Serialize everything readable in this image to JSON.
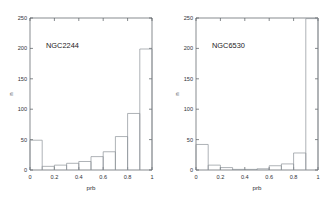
{
  "figure": {
    "background": "#ffffff",
    "axis_color": "#555a5e",
    "bar_color": "#8d9298",
    "text_color": "#303337"
  },
  "chart_data": [
    {
      "type": "bar",
      "title": "NGC2244",
      "xlabel": "prb",
      "ylabel": "n",
      "xlim": [
        0,
        1
      ],
      "ylim": [
        0,
        250
      ],
      "grid": false,
      "legend": null,
      "bin_width": 0.1,
      "xticks": [
        0,
        0.2,
        0.4,
        0.6,
        0.8,
        1
      ],
      "xticklabels": [
        "0",
        "0.2",
        "0.4",
        "0.6",
        "0.8",
        "1"
      ],
      "yticks": [
        0,
        50,
        100,
        150,
        200,
        250
      ],
      "yticklabels": [
        "0",
        "50",
        "100",
        "150",
        "200",
        "250"
      ],
      "bin_edges": [
        0,
        0.1,
        0.2,
        0.3,
        0.4,
        0.5,
        0.6,
        0.7,
        0.8,
        0.9,
        1.0
      ],
      "categories": [
        "0-0.1",
        "0.1-0.2",
        "0.2-0.3",
        "0.3-0.4",
        "0.4-0.5",
        "0.5-0.6",
        "0.6-0.7",
        "0.7-0.8",
        "0.8-0.9",
        "0.9-1.0"
      ],
      "values": [
        49,
        6,
        8,
        11,
        14,
        22,
        30,
        55,
        93,
        199
      ]
    },
    {
      "type": "bar",
      "title": "NGC6530",
      "xlabel": "prb",
      "ylabel": "n",
      "xlim": [
        0,
        1
      ],
      "ylim": [
        0,
        250
      ],
      "grid": false,
      "legend": null,
      "bin_width": 0.1,
      "xticks": [
        0,
        0.2,
        0.4,
        0.6,
        0.8,
        1
      ],
      "xticklabels": [
        "0",
        "0.2",
        "0.4",
        "0.6",
        "0.8",
        "1"
      ],
      "yticks": [
        0,
        50,
        100,
        150,
        200,
        250
      ],
      "yticklabels": [
        "0",
        "50",
        "100",
        "150",
        "200",
        "250"
      ],
      "bin_edges": [
        0,
        0.1,
        0.2,
        0.3,
        0.4,
        0.5,
        0.6,
        0.7,
        0.8,
        0.9,
        1.0
      ],
      "categories": [
        "0-0.1",
        "0.1-0.2",
        "0.2-0.3",
        "0.3-0.4",
        "0.4-0.5",
        "0.5-0.6",
        "0.6-0.7",
        "0.7-0.8",
        "0.8-0.9",
        "0.9-1.0"
      ],
      "values": [
        42,
        8,
        4,
        1,
        1,
        2,
        7,
        10,
        28,
        249
      ]
    }
  ]
}
